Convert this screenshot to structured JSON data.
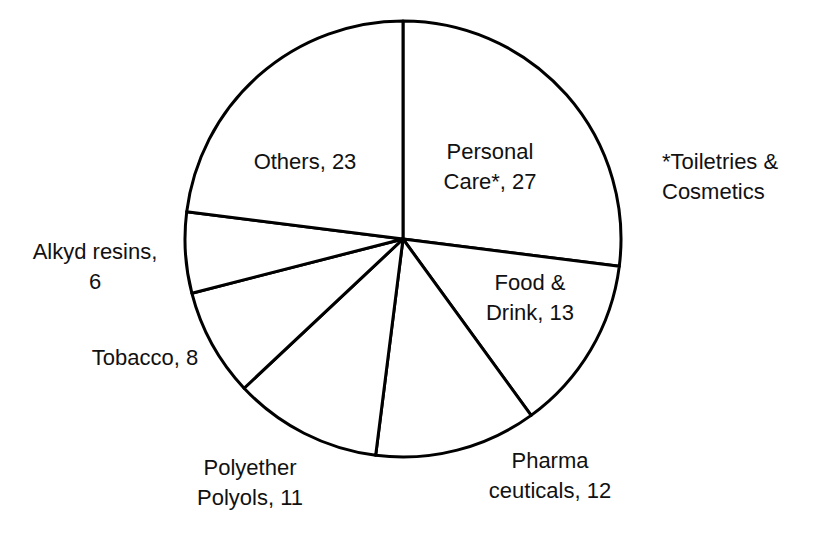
{
  "chart_data": {
    "type": "pie",
    "title": "",
    "start_angle_deg": 0,
    "direction": "clockwise",
    "slices": [
      {
        "label": "Personal Care*",
        "value": 27
      },
      {
        "label": "Food & Drink",
        "value": 13
      },
      {
        "label": "Pharmaceuticals",
        "value": 12
      },
      {
        "label": "Polyether Polyols",
        "value": 11
      },
      {
        "label": "Tobacco",
        "value": 8
      },
      {
        "label": "Alkyd resins",
        "value": 6
      },
      {
        "label": "Others",
        "value": 23
      }
    ],
    "annotation": "*Toiletries & Cosmetics",
    "colors": {
      "fill": "#ffffff",
      "stroke": "#000000"
    }
  },
  "labels": {
    "personal_care": "Personal\nCare*, 27",
    "food_drink": "Food &\nDrink, 13",
    "pharma": "Pharma\nceuticals, 12",
    "polyether": "Polyether\nPolyols, 11",
    "tobacco": "Tobacco, 8",
    "alkyd": "Alkyd resins,\n6",
    "others": "Others, 23",
    "footnote": "*Toiletries &\nCosmetics"
  }
}
